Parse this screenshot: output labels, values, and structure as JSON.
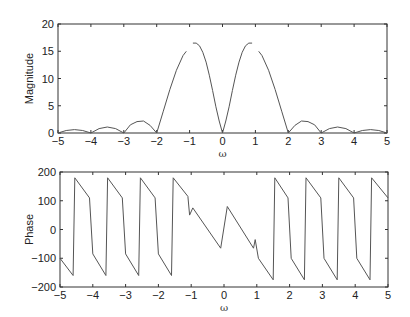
{
  "chart_data": [
    {
      "type": "line",
      "title": "",
      "xlabel": "ω",
      "ylabel": "Magnitude",
      "xlim": [
        -5,
        5
      ],
      "ylim": [
        0,
        20
      ],
      "xticks": [
        -5,
        -4,
        -3,
        -2,
        -1,
        0,
        1,
        2,
        3,
        4,
        5
      ],
      "xtick_labels": [
        "−5",
        "−4",
        "−3",
        "−2",
        "−1",
        "0",
        "1",
        "2",
        "3",
        "4",
        "5"
      ],
      "yticks": [
        0,
        5,
        10,
        15,
        20
      ],
      "ytick_labels": [
        "0",
        "5",
        "10",
        "15",
        "20"
      ],
      "grid": false,
      "legend": null,
      "line_color": "#555555",
      "segments": [
        {
          "x": [
            -5,
            -4.75,
            -4.5,
            -4.25,
            -4
          ],
          "y": [
            0,
            0.45,
            0.62,
            0.45,
            0
          ]
        },
        {
          "x": [
            -4,
            -3.75,
            -3.5,
            -3.25,
            -3
          ],
          "y": [
            0,
            0.8,
            1.1,
            0.8,
            0
          ]
        },
        {
          "x": [
            -3,
            -2.8,
            -2.6,
            -2.4,
            -2.2,
            -2
          ],
          "y": [
            0,
            1.5,
            2.1,
            2.2,
            1.4,
            0
          ]
        },
        {
          "x": [
            -2,
            -1.8,
            -1.6,
            -1.4,
            -1.2,
            -1.1
          ],
          "y": [
            0,
            4.0,
            8.0,
            11.5,
            14.2,
            15.0
          ]
        },
        {
          "x": [
            -0.9,
            -0.8,
            -0.7,
            -0.6,
            -0.5,
            -0.4,
            -0.3,
            -0.2,
            -0.1,
            0
          ],
          "y": [
            16.5,
            16.5,
            16.0,
            14.8,
            13.0,
            10.6,
            7.8,
            4.8,
            2.2,
            0
          ]
        },
        {
          "x": [
            0,
            0.1,
            0.2,
            0.3,
            0.4,
            0.5,
            0.6,
            0.7,
            0.8,
            0.9
          ],
          "y": [
            0,
            2.2,
            4.8,
            7.8,
            10.6,
            13.0,
            14.8,
            16.0,
            16.5,
            16.5
          ]
        },
        {
          "x": [
            1.1,
            1.2,
            1.4,
            1.6,
            1.8,
            2
          ],
          "y": [
            15.0,
            14.2,
            11.5,
            8.0,
            4.0,
            0
          ]
        },
        {
          "x": [
            2,
            2.2,
            2.4,
            2.6,
            2.8,
            3
          ],
          "y": [
            0,
            1.4,
            2.2,
            2.1,
            1.5,
            0
          ]
        },
        {
          "x": [
            3,
            3.25,
            3.5,
            3.75,
            4
          ],
          "y": [
            0,
            0.8,
            1.1,
            0.8,
            0
          ]
        },
        {
          "x": [
            4,
            4.25,
            4.5,
            4.75,
            5
          ],
          "y": [
            0,
            0.45,
            0.62,
            0.45,
            0
          ]
        }
      ]
    },
    {
      "type": "line",
      "title": "",
      "xlabel": "ω",
      "ylabel": "Phase",
      "xlim": [
        -5,
        5
      ],
      "ylim": [
        -200,
        200
      ],
      "xticks": [
        -5,
        -4,
        -3,
        -2,
        -1,
        0,
        1,
        2,
        3,
        4,
        5
      ],
      "xtick_labels": [
        "−5",
        "−4",
        "−3",
        "−2",
        "−1",
        "0",
        "1",
        "2",
        "3",
        "4",
        "5"
      ],
      "yticks": [
        -200,
        -100,
        0,
        100,
        200
      ],
      "ytick_labels": [
        "−200",
        "−100",
        "0",
        "100",
        "200"
      ],
      "grid": false,
      "legend": null,
      "line_color": "#555555",
      "segments": [
        {
          "x": [
            -5,
            -4.6,
            -4.55,
            -4.1,
            -4.0,
            -3.6,
            -3.55,
            -3.1,
            -3.0,
            -2.6,
            -2.55,
            -2.1,
            -2.0,
            -1.6,
            -1.55,
            -1.1,
            -1.05,
            -0.95,
            -0.1,
            0.1,
            0.9,
            0.95,
            1.05,
            1.5,
            1.55,
            1.95,
            2.05,
            2.45,
            2.5,
            2.95,
            3.05,
            3.45,
            3.5,
            3.95,
            4.05,
            4.45,
            4.5,
            5
          ],
          "y": [
            -100,
            -160,
            180,
            110,
            -85,
            -160,
            180,
            110,
            -85,
            -160,
            180,
            110,
            -85,
            -160,
            180,
            115,
            50,
            75,
            -65,
            80,
            -65,
            -35,
            -100,
            -175,
            180,
            110,
            -100,
            -175,
            180,
            110,
            -100,
            -175,
            180,
            110,
            -100,
            -175,
            180,
            110
          ]
        }
      ]
    }
  ]
}
